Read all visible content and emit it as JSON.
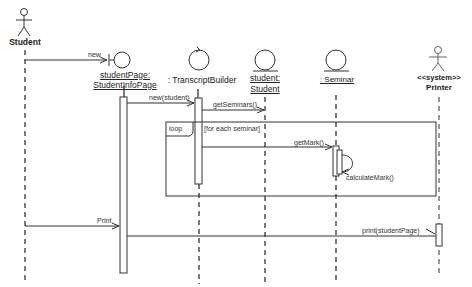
{
  "diagram": {
    "type": "UML sequence diagram",
    "participants": [
      {
        "id": "student",
        "kind": "actor",
        "label": "Student",
        "underline": false,
        "bold": true
      },
      {
        "id": "studentPage",
        "kind": "boundary",
        "label_line1": "studentPage:",
        "label_line2": "StudentInfoPage",
        "underline": true
      },
      {
        "id": "transcriptBuilder",
        "kind": "control",
        "label": ": TranscriptBuilder",
        "underline": false
      },
      {
        "id": "studentEntity",
        "kind": "entity",
        "label_line1": "student:",
        "label_line2": "Student",
        "underline": true
      },
      {
        "id": "seminar",
        "kind": "entity",
        "label": ": Seminar",
        "underline": true
      },
      {
        "id": "printer",
        "kind": "actor",
        "label_line1": "<<system>>",
        "label_line2": "Printer",
        "bold": true
      }
    ],
    "messages": [
      {
        "from": "student",
        "to": "studentPage",
        "label": "new"
      },
      {
        "from": "studentPage",
        "to": "transcriptBuilder",
        "label": "new(student)"
      },
      {
        "from": "transcriptBuilder",
        "to": "studentEntity",
        "label": "getSeminars()"
      },
      {
        "from": "transcriptBuilder",
        "to": "seminar",
        "label": "getMark()"
      },
      {
        "from": "seminar",
        "to": "seminar",
        "label": "calculateMark()"
      },
      {
        "from": "student",
        "to": "studentPage",
        "label": "Print"
      },
      {
        "from": "studentPage",
        "to": "printer",
        "label": "print(studentPage)"
      }
    ],
    "fragments": [
      {
        "operator": "loop",
        "guard": "[for each seminar]"
      }
    ]
  }
}
